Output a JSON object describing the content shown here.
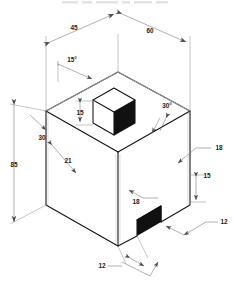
{
  "drawing": {
    "type": "isometric-engineering-drawing",
    "subject": "house-shaped solid with chimney and door opening",
    "background_color": "#ffffff",
    "line_color": "#111111",
    "dimension_color": "#6f6f6f",
    "shaded_face_color": "#111111",
    "units": "unitless",
    "top_partial_text": ""
  },
  "dimensions": [
    {
      "id": "roof-left-run",
      "label": "45",
      "kind": "linear",
      "placement": "top-left"
    },
    {
      "id": "roof-right-run",
      "label": "60",
      "kind": "linear",
      "placement": "top-right"
    },
    {
      "id": "roof-left-angle",
      "label": "15°",
      "kind": "angular",
      "placement": "upper-left"
    },
    {
      "id": "roof-right-angle",
      "label": "30°",
      "kind": "angular",
      "placement": "upper-right"
    },
    {
      "id": "chimney-height",
      "label": "15",
      "kind": "linear",
      "placement": "center"
    },
    {
      "id": "overall-height",
      "label": "85",
      "kind": "linear",
      "placement": "far-left"
    },
    {
      "id": "gable-left",
      "label": "30",
      "kind": "linear",
      "placement": "left"
    },
    {
      "id": "wall-left-depth",
      "label": "21",
      "kind": "linear",
      "placement": "left-lower"
    },
    {
      "id": "right-upper-offset",
      "label": "18",
      "kind": "linear",
      "placement": "right-upper"
    },
    {
      "id": "front-lower-offset",
      "label": "18",
      "kind": "linear",
      "placement": "center-lower"
    },
    {
      "id": "door-height",
      "label": "15",
      "kind": "linear",
      "placement": "right-lower"
    },
    {
      "id": "door-width",
      "label": "12",
      "kind": "linear",
      "placement": "right-bottom"
    },
    {
      "id": "base-front-width",
      "label": "12",
      "kind": "linear",
      "placement": "bottom"
    }
  ]
}
